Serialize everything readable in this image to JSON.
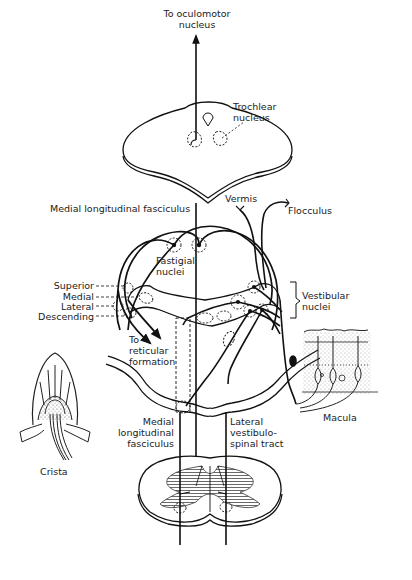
{
  "diagram": {
    "type": "neuroanatomy-schematic",
    "labels": {
      "oculomotor_line1": "To oculomotor",
      "oculomotor_line2": "nucleus",
      "trochlear_line1": "Trochlear",
      "trochlear_line2": "nucleus",
      "mlf_top": "Medial longitudinal fasciculus",
      "vermis": "Vermis",
      "flocculus": "Flocculus",
      "fastigial_line1": "Fastigial",
      "fastigial_line2": "nuclei",
      "vestibular_line1": "Vestibular",
      "vestibular_line2": "nuclei",
      "superior": "Superior",
      "medial": "Medial",
      "lateral": "Lateral",
      "descending": "Descending",
      "reticular_line1": "To",
      "reticular_line2": "reticular",
      "reticular_line3": "formation",
      "macula": "Macula",
      "crista": "Crista",
      "mlf_bottom_line1": "Medial",
      "mlf_bottom_line2": "longitudinal",
      "mlf_bottom_line3": "fasciculus",
      "lvst_line1": "Lateral",
      "lvst_line2": "vestibulo-",
      "lvst_line3": "spinal tract"
    },
    "nodes": [
      "Oculomotor nucleus",
      "Trochlear nucleus",
      "Fastigial nuclei",
      "Vestibular nuclei (Superior, Medial, Lateral, Descending)",
      "Reticular formation",
      "Vermis",
      "Flocculus",
      "Macula",
      "Crista",
      "Spinal cord"
    ],
    "edges": [
      {
        "from": "Vestibular nuclei",
        "to": "Oculomotor nucleus",
        "via": "Medial longitudinal fasciculus"
      },
      {
        "from": "Vestibular nuclei",
        "to": "Trochlear nucleus",
        "via": "Medial longitudinal fasciculus"
      },
      {
        "from": "Vestibular nuclei",
        "to": "Reticular formation"
      },
      {
        "from": "Vermis",
        "to": "Vestibular nuclei"
      },
      {
        "from": "Flocculus",
        "to": "Vestibular nuclei"
      },
      {
        "from": "Fastigial nuclei",
        "to": "Vestibular nuclei"
      },
      {
        "from": "Macula",
        "to": "Vestibular nuclei"
      },
      {
        "from": "Crista",
        "to": "Vestibular nuclei"
      },
      {
        "from": "Vestibular nuclei",
        "to": "Spinal cord",
        "via": "Lateral vestibulospinal tract"
      },
      {
        "from": "Vestibular nuclei",
        "to": "Spinal cord",
        "via": "Medial longitudinal fasciculus"
      }
    ],
    "colors": {
      "ink": "#111111",
      "background": "#ffffff",
      "hatch": "#444444"
    }
  }
}
